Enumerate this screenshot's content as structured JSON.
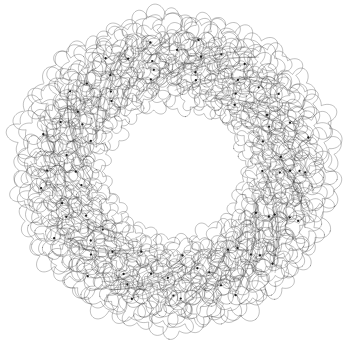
{
  "canvas": {
    "width": 354,
    "height": 340,
    "background_color": "#ffffff",
    "title": "Spirograph Annular Rosette"
  },
  "figure": {
    "name": "spirograph-ring",
    "kind": "generative-line-art",
    "center_x": 175,
    "center_y": 171,
    "outer_radius": 155,
    "inner_radius": 70,
    "band_mid_radius": 112,
    "band_width": 85,
    "stroke_color": "#3a3a3a",
    "node_color": "#1a1a1a",
    "stroke_width": 0.45,
    "stroke_opacity": 0.72
  },
  "chart_data": {
    "type": "line",
    "title": "Spirograph Annular Rosette",
    "xlabel": "",
    "ylabel": "",
    "xlim": [
      0,
      354
    ],
    "ylim": [
      0,
      340
    ],
    "grid": false,
    "legend": "none",
    "generator": "epitrochoid-petal-ring",
    "params": {
      "center": [
        175,
        171
      ],
      "outer_radius": 155,
      "inner_radius": 70,
      "ring_count": 7,
      "petals_per_ring": 46,
      "petal_lobes": 5,
      "petal_radius_min": 15,
      "petal_radius_max": 24,
      "radial_jitter": 5.5,
      "angular_jitter": 0.022,
      "node_count": 186,
      "node_radius": 1.15,
      "seed": 20240517
    },
    "rings": [
      {
        "index": 0,
        "radius": 78,
        "petals": 34,
        "petal_radius": 16.0,
        "lobes": 5
      },
      {
        "index": 1,
        "radius": 90,
        "petals": 38,
        "petal_radius": 17.5,
        "lobes": 5
      },
      {
        "index": 2,
        "radius": 101,
        "petals": 42,
        "petal_radius": 19.0,
        "lobes": 5
      },
      {
        "index": 3,
        "radius": 112,
        "petals": 46,
        "petal_radius": 20.5,
        "lobes": 5
      },
      {
        "index": 4,
        "radius": 123,
        "petals": 48,
        "petal_radius": 21.5,
        "lobes": 5
      },
      {
        "index": 5,
        "radius": 133,
        "petals": 50,
        "petal_radius": 22.5,
        "lobes": 5
      },
      {
        "index": 6,
        "radius": 142,
        "petals": 52,
        "petal_radius": 23.5,
        "lobes": 5
      }
    ]
  }
}
